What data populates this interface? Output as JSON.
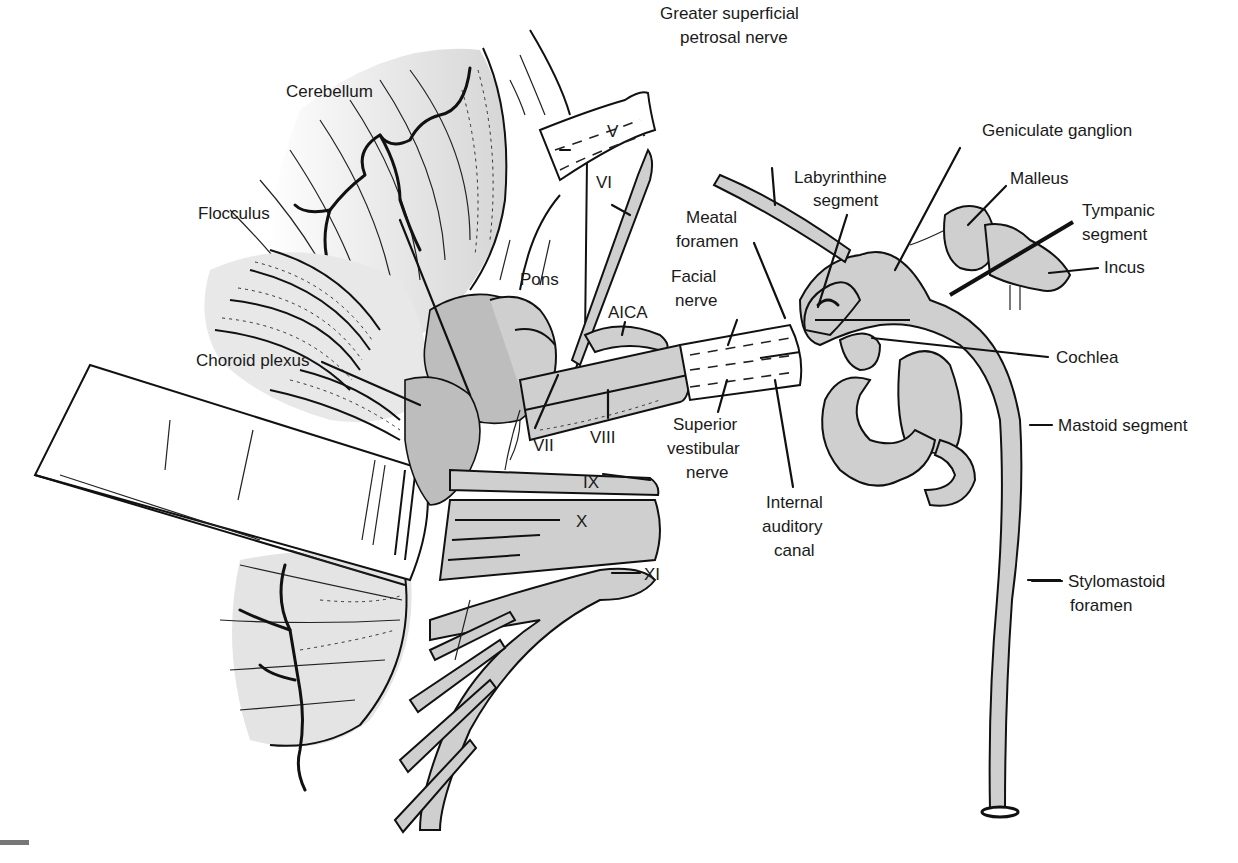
{
  "figure": {
    "labels": {
      "cerebellum": "Cerebellum",
      "flocculus": "Flocculus",
      "choroid_plexus": "Choroid plexus",
      "pons": "Pons",
      "aica": "AICA",
      "cn_v": "V",
      "cn_vi": "VI",
      "cn_vii": "VII",
      "cn_viii": "VIII",
      "cn_ix": "IX",
      "cn_x": "X",
      "cn_xi": "XI",
      "gsp_line1": "Greater superficial",
      "gsp_line2": "petrosal nerve",
      "geniculate_ganglion": "Geniculate ganglion",
      "labyrinthine_line1": "Labyrinthine",
      "labyrinthine_line2": "segment",
      "malleus": "Malleus",
      "tympanic_line1": "Tympanic",
      "tympanic_line2": "segment",
      "incus": "Incus",
      "meatal_line1": "Meatal",
      "meatal_line2": "foramen",
      "facial_line1": "Facial",
      "facial_line2": "nerve",
      "cochlea": "Cochlea",
      "mastoid_segment": "Mastoid segment",
      "sup_vest_line1": "Superior",
      "sup_vest_line2": "vestibular",
      "sup_vest_line3": "nerve",
      "iac_line1": "Internal",
      "iac_line2": "auditory",
      "iac_line3": "canal",
      "stylomastoid_line1": "Stylomastoid",
      "stylomastoid_line2": "foramen"
    },
    "colors": {
      "structure_fill": "#cfcfcf",
      "line": "#111111",
      "background": "#ffffff"
    }
  }
}
